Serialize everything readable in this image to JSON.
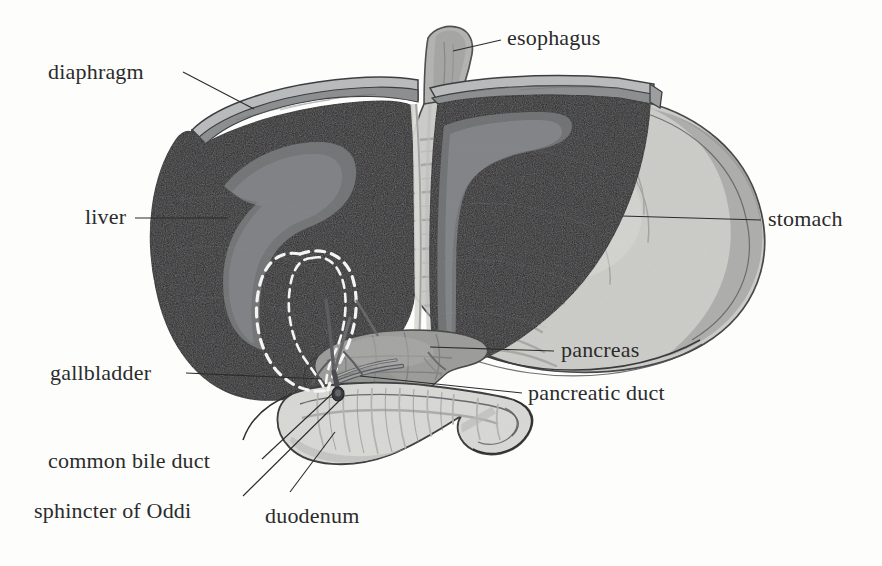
{
  "figure": {
    "width": 882,
    "height": 566,
    "background_color": "#fdfdfc",
    "style": "grayscale medical line illustration"
  },
  "palette": {
    "background": "#fdfdfc",
    "liver_dark": "#272628",
    "liver_highlight": "#77787a",
    "diaphragm_gray": "#8d8e90",
    "diaphragm_light": "#b9babc",
    "stomach_fill": "#c9cac6",
    "stomach_shade": "#a9aaa7",
    "stomach_light": "#dcdcd8",
    "pancreas_fill": "#9a9b98",
    "pancreas_shade": "#868784",
    "duodenum_fill": "#d8d9d5",
    "duodenum_shade": "#b6b7b3",
    "esophagus_fill": "#a8a9a6",
    "duct_gray": "#76777a",
    "outline": "#2f2f31",
    "leader_line": "#2b2b2b",
    "dashed_outline": "#f4f4f2",
    "text": "#2b2b2b"
  },
  "labels": [
    {
      "id": "diaphragm",
      "text": "diaphragm",
      "x": 48,
      "y": 61,
      "align": "left",
      "leader": {
        "x1": 183,
        "y1": 72,
        "x2": 254,
        "y2": 109
      }
    },
    {
      "id": "esophagus",
      "text": "esophagus",
      "x": 507,
      "y": 27,
      "align": "left",
      "leader": {
        "x1": 501,
        "y1": 40,
        "x2": 453,
        "y2": 51
      }
    },
    {
      "id": "liver",
      "text": "liver",
      "x": 85,
      "y": 206,
      "align": "left",
      "leader": {
        "x1": 135,
        "y1": 218,
        "x2": 228,
        "y2": 218
      }
    },
    {
      "id": "stomach",
      "text": "stomach",
      "x": 768,
      "y": 208,
      "align": "left",
      "leader": {
        "x1": 761,
        "y1": 220,
        "x2": 622,
        "y2": 216
      }
    },
    {
      "id": "pancreas",
      "text": "pancreas",
      "x": 561,
      "y": 339,
      "align": "left",
      "leader": {
        "x1": 554,
        "y1": 351,
        "x2": 430,
        "y2": 347
      }
    },
    {
      "id": "gallbladder",
      "text": "gallbladder",
      "x": 50,
      "y": 362,
      "align": "left",
      "leader": {
        "x1": 186,
        "y1": 373,
        "x2": 322,
        "y2": 379
      }
    },
    {
      "id": "pancreatic-duct",
      "text": "pancreatic duct",
      "x": 528,
      "y": 382,
      "align": "left",
      "leader": {
        "x1": 522,
        "y1": 393,
        "x2": 360,
        "y2": 376
      }
    },
    {
      "id": "common-bile-duct",
      "text": "common bile duct",
      "x": 48,
      "y": 450,
      "align": "left",
      "leader": {
        "x1": 262,
        "y1": 459,
        "x2": 334,
        "y2": 392
      }
    },
    {
      "id": "sphincter-of-oddi",
      "text": "sphincter of Oddi",
      "x": 34,
      "y": 500,
      "align": "left",
      "leader": {
        "x1": 243,
        "y1": 496,
        "x2": 340,
        "y2": 400
      }
    },
    {
      "id": "duodenum",
      "text": "duodenum",
      "x": 265,
      "y": 505,
      "align": "left",
      "leader": {
        "x1": 290,
        "y1": 492,
        "x2": 335,
        "y2": 432
      }
    }
  ],
  "structures": [
    {
      "id": "diaphragm",
      "name": "diaphragm",
      "description": "thin curved muscular band arching over the superior surface of the liver"
    },
    {
      "id": "esophagus",
      "name": "esophagus",
      "description": "tubular segment descending to the stomach cardia"
    },
    {
      "id": "liver",
      "name": "liver",
      "description": "large dark organ with right and left lobes, pale falciform highlight"
    },
    {
      "id": "stomach",
      "name": "stomach",
      "description": "rounded sac with rugal folds lying right of the liver"
    },
    {
      "id": "pancreas",
      "name": "pancreas",
      "description": "lobulated gland lying behind the stomach, head in duodenal curve"
    },
    {
      "id": "gallbladder",
      "name": "gallbladder",
      "description": "pear-shaped sac shown as dashed outline behind the liver"
    },
    {
      "id": "pancreatic-duct",
      "name": "pancreatic duct",
      "description": "duct draining the pancreas into the duodenum"
    },
    {
      "id": "common-bile-duct",
      "name": "common bile duct",
      "description": "duct from the gallbladder and liver to the duodenum"
    },
    {
      "id": "sphincter-of-oddi",
      "name": "sphincter of Oddi",
      "description": "muscular valve where the ducts enter the duodenum"
    },
    {
      "id": "duodenum",
      "name": "duodenum",
      "description": "C-shaped first portion of the small intestine"
    }
  ]
}
